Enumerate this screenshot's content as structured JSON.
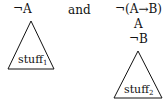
{
  "left": {
    "formula": "¬A",
    "tree_label": "stuff",
    "tree_subscript": "1"
  },
  "connector": "and",
  "right": {
    "formulas": [
      "¬(A→B)",
      "A",
      "¬B"
    ],
    "tree_label": "stuff",
    "tree_subscript": "2"
  }
}
